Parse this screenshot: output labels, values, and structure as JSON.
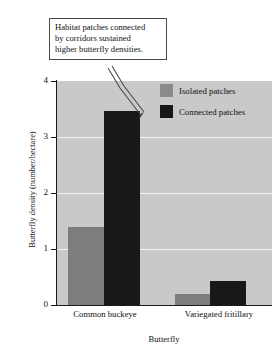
{
  "callout": {
    "lines": [
      "Habitat patches connected",
      "by corridors sustained",
      "higher butterfly densities."
    ]
  },
  "legend": {
    "items": [
      {
        "label": "Isolated patches",
        "color": "#8a8a8a",
        "key": "isolated"
      },
      {
        "label": "Connected patches",
        "color": "#181818",
        "key": "connected"
      }
    ]
  },
  "chart_data": {
    "type": "bar",
    "title": "",
    "xlabel": "Butterfly",
    "ylabel": "Butterfly density (number/hectare)",
    "categories": [
      "Common buckeye",
      "Variegated fritillary"
    ],
    "series": [
      {
        "name": "Isolated patches",
        "color": "#7d7d7d",
        "values": [
          1.4,
          0.2
        ]
      },
      {
        "name": "Connected patches",
        "color": "#181818",
        "values": [
          3.47,
          0.43
        ]
      }
    ],
    "ylim": [
      0,
      4
    ],
    "yticks": [
      0,
      1,
      2,
      3,
      4
    ],
    "ytick_labels": [
      "0",
      "1",
      "2",
      "3",
      "4"
    ],
    "gridlines": [
      1,
      2,
      3
    ],
    "grid": true,
    "legend_position": "top-right-inside",
    "plot_background": "#c9c9c9",
    "gridline_color": "#f2f2f2"
  }
}
